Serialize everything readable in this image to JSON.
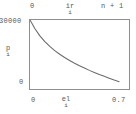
{
  "figure": {
    "top_axis": {
      "left_label": "0",
      "mid_label": "ir",
      "mid_subscript": "i",
      "right_label": "n + 1"
    },
    "y_axis": {
      "max_label": "30000",
      "min_label": "0",
      "title": "p",
      "title_subscript": "i"
    },
    "x_axis": {
      "min_label": "0",
      "title": "el",
      "title_subscript": "i",
      "max_label": "0.7"
    },
    "colors": {
      "curve": "#6b6b6b",
      "frame": "#8e8e8e",
      "text": "#585858",
      "background": "#ffffff"
    }
  },
  "chart_data": {
    "type": "line",
    "title": "",
    "xlabel": "el_i",
    "ylabel": "p_i",
    "xlim": [
      0,
      0.7
    ],
    "ylim": [
      0,
      30000
    ],
    "grid": false,
    "legend": null,
    "top_axis": {
      "label": "ir_i",
      "ticks": [
        "0",
        "n + 1"
      ]
    },
    "series": [
      {
        "name": "p_i vs el_i",
        "x": [
          0.0,
          0.035,
          0.07,
          0.105,
          0.14,
          0.175,
          0.21,
          0.245,
          0.28,
          0.315,
          0.35,
          0.385,
          0.42,
          0.455,
          0.49,
          0.525,
          0.56,
          0.595,
          0.63
        ],
        "y": [
          30000,
          26200,
          23100,
          20600,
          18500,
          16700,
          15100,
          13700,
          12400,
          11200,
          10100,
          9100,
          8100,
          7200,
          6300,
          5500,
          4700,
          3900,
          3200
        ]
      }
    ],
    "xticks": [
      0,
      0.7
    ],
    "yticks": [
      0,
      30000
    ],
    "xticklabels": [
      "0",
      "0.7"
    ],
    "yticklabels": [
      "0",
      "30000"
    ]
  }
}
